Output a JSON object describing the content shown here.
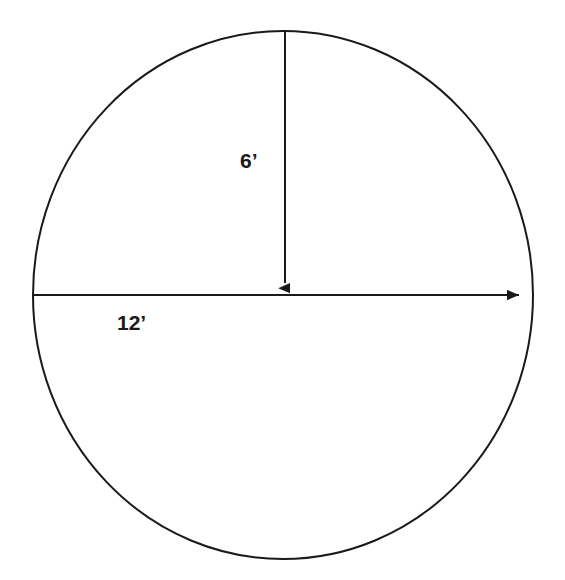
{
  "figure": {
    "type": "geometry-diagram",
    "shape": "circle",
    "background_color": "#ffffff",
    "stroke_color": "#1a1a1a",
    "text_color": "#1a1a1a",
    "canvas": {
      "width": 565,
      "height": 580
    },
    "circle": {
      "name": "circle-outline",
      "center_x": 283,
      "center_y": 295,
      "radius_x": 250,
      "radius_y": 264,
      "stroke_width": 2
    },
    "dimensions": [
      {
        "id": "radius",
        "label": "6’",
        "value": 6,
        "unit": "feet",
        "unit_symbol": "’",
        "measures": "radius",
        "orientation": "vertical",
        "from_x": 285,
        "from_y": 31,
        "to_x": 285,
        "to_y": 295,
        "arrow_at": "end"
      },
      {
        "id": "diameter",
        "label": "12’",
        "value": 12,
        "unit": "feet",
        "unit_symbol": "’",
        "measures": "diameter",
        "orientation": "horizontal",
        "from_x": 33,
        "from_y": 295,
        "to_x": 531,
        "to_y": 295,
        "arrow_at": "end"
      }
    ]
  }
}
